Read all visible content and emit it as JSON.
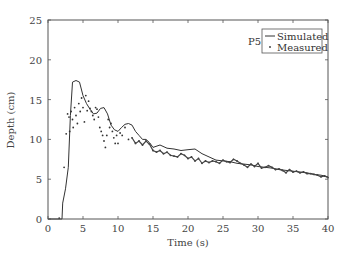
{
  "chart_data": {
    "type": "line",
    "title": "",
    "annotation": "P5",
    "xlabel": "Time (s)",
    "ylabel": "Depth (cm)",
    "xlim": [
      0,
      40
    ],
    "ylim": [
      0,
      25
    ],
    "xticks": [
      0,
      5,
      10,
      15,
      20,
      25,
      30,
      35,
      40
    ],
    "yticks": [
      0,
      5,
      10,
      15,
      20,
      25
    ],
    "grid": false,
    "legend_position": "upper right",
    "legend": [
      "Simulated",
      "Measured"
    ],
    "series": [
      {
        "name": "Simulated",
        "style": "solid-line",
        "x": [
          0,
          2.0,
          2.1,
          2.5,
          2.9,
          3.2,
          3.5,
          4.0,
          4.5,
          5.0,
          5.5,
          6.0,
          6.5,
          7.0,
          7.5,
          8.0,
          8.5,
          9.0,
          9.5,
          10.0,
          10.5,
          11.0,
          11.5,
          12.0,
          12.5,
          13.0,
          13.5,
          14.0,
          14.5,
          15.0,
          16.0,
          17.0,
          18.0,
          19.0,
          20.0,
          21.0,
          22.0,
          23.0,
          24.0,
          25.0,
          26.0,
          27.0,
          28.0,
          29.0,
          30.0,
          31.0,
          32.0,
          33.0,
          34.0,
          35.0,
          36.0,
          37.0,
          38.0,
          39.0,
          40.0
        ],
        "y": [
          0,
          0,
          2.0,
          3.8,
          6.5,
          13.0,
          17.2,
          17.4,
          17.2,
          15.5,
          14.5,
          13.8,
          13.2,
          13.3,
          13.9,
          14.0,
          13.2,
          11.8,
          11.2,
          11.0,
          11.5,
          11.9,
          12.0,
          11.8,
          11.0,
          10.5,
          10.0,
          10.0,
          9.6,
          9.0,
          9.3,
          8.9,
          8.8,
          8.6,
          8.7,
          8.8,
          8.2,
          7.8,
          7.4,
          7.3,
          7.2,
          7.0,
          6.9,
          6.8,
          6.6,
          6.5,
          6.4,
          6.2,
          6.1,
          6.0,
          5.9,
          5.8,
          5.6,
          5.5,
          5.3
        ]
      },
      {
        "name": "Measured",
        "style": "dots",
        "x": [
          1.6,
          2.3,
          2.6,
          2.8,
          3.0,
          3.1,
          3.3,
          3.5,
          3.6,
          3.8,
          4.0,
          4.2,
          4.4,
          4.6,
          4.8,
          5.0,
          5.2,
          5.4,
          5.6,
          5.8,
          6.0,
          6.2,
          6.4,
          6.6,
          6.8,
          7.0,
          7.2,
          7.4,
          7.6,
          7.8,
          8.0,
          8.2,
          8.4,
          8.6,
          8.8,
          9.0,
          9.2,
          9.4,
          9.6,
          9.8,
          10.0,
          10.3,
          10.6,
          11.0,
          11.5,
          12.0,
          12.5,
          13.0,
          13.5,
          14.0,
          14.5,
          15.0,
          15.5,
          16.0,
          16.5,
          17.0,
          17.5,
          18.0,
          18.5,
          19.0,
          19.5,
          20.0,
          20.5,
          21.0,
          21.5,
          22.0,
          22.5,
          23.0,
          23.5,
          24.0,
          24.5,
          25.0,
          25.5,
          26.0,
          26.5,
          27.0,
          27.5,
          28.0,
          28.5,
          29.0,
          29.5,
          30.0,
          30.5,
          31.0,
          31.5,
          32.0,
          32.5,
          33.0,
          33.5,
          34.0,
          34.5,
          35.0,
          35.5,
          36.0,
          36.5,
          37.0,
          37.5,
          38.0,
          38.5,
          39.0,
          39.5,
          40.0
        ],
        "y": [
          0.1,
          6.5,
          10.7,
          13.2,
          12.8,
          11.0,
          13.5,
          12.5,
          11.5,
          14.0,
          13.0,
          12.0,
          14.5,
          13.5,
          15.2,
          14.0,
          12.2,
          15.5,
          13.6,
          14.8,
          13.9,
          13.5,
          13.0,
          12.5,
          14.0,
          13.8,
          12.8,
          11.5,
          11.0,
          10.5,
          9.8,
          9.0,
          10.5,
          12.5,
          11.5,
          12.0,
          11.0,
          10.2,
          9.5,
          10.5,
          9.5,
          10.8,
          10.5,
          11.5,
          10.0,
          10.2,
          9.5,
          9.8,
          9.3,
          9.8,
          9.4,
          8.6,
          8.4,
          8.6,
          8.2,
          8.4,
          8.0,
          7.9,
          7.8,
          8.2,
          8.0,
          7.6,
          7.8,
          7.3,
          7.6,
          7.0,
          7.3,
          7.1,
          7.3,
          7.2,
          7.0,
          7.4,
          7.2,
          7.1,
          7.5,
          7.3,
          7.0,
          6.8,
          6.5,
          6.9,
          6.6,
          7.0,
          6.4,
          6.5,
          6.7,
          6.5,
          6.2,
          6.3,
          6.1,
          5.8,
          6.2,
          5.9,
          6.0,
          5.8,
          5.9,
          5.7,
          5.7,
          5.6,
          5.5,
          5.3,
          5.4,
          5.2
        ]
      }
    ]
  },
  "legend": {
    "simulated_label": "Simulated",
    "measured_label": "Measured"
  },
  "annotation": "P5",
  "xlabel": "Time (s)",
  "ylabel": "Depth (cm)"
}
